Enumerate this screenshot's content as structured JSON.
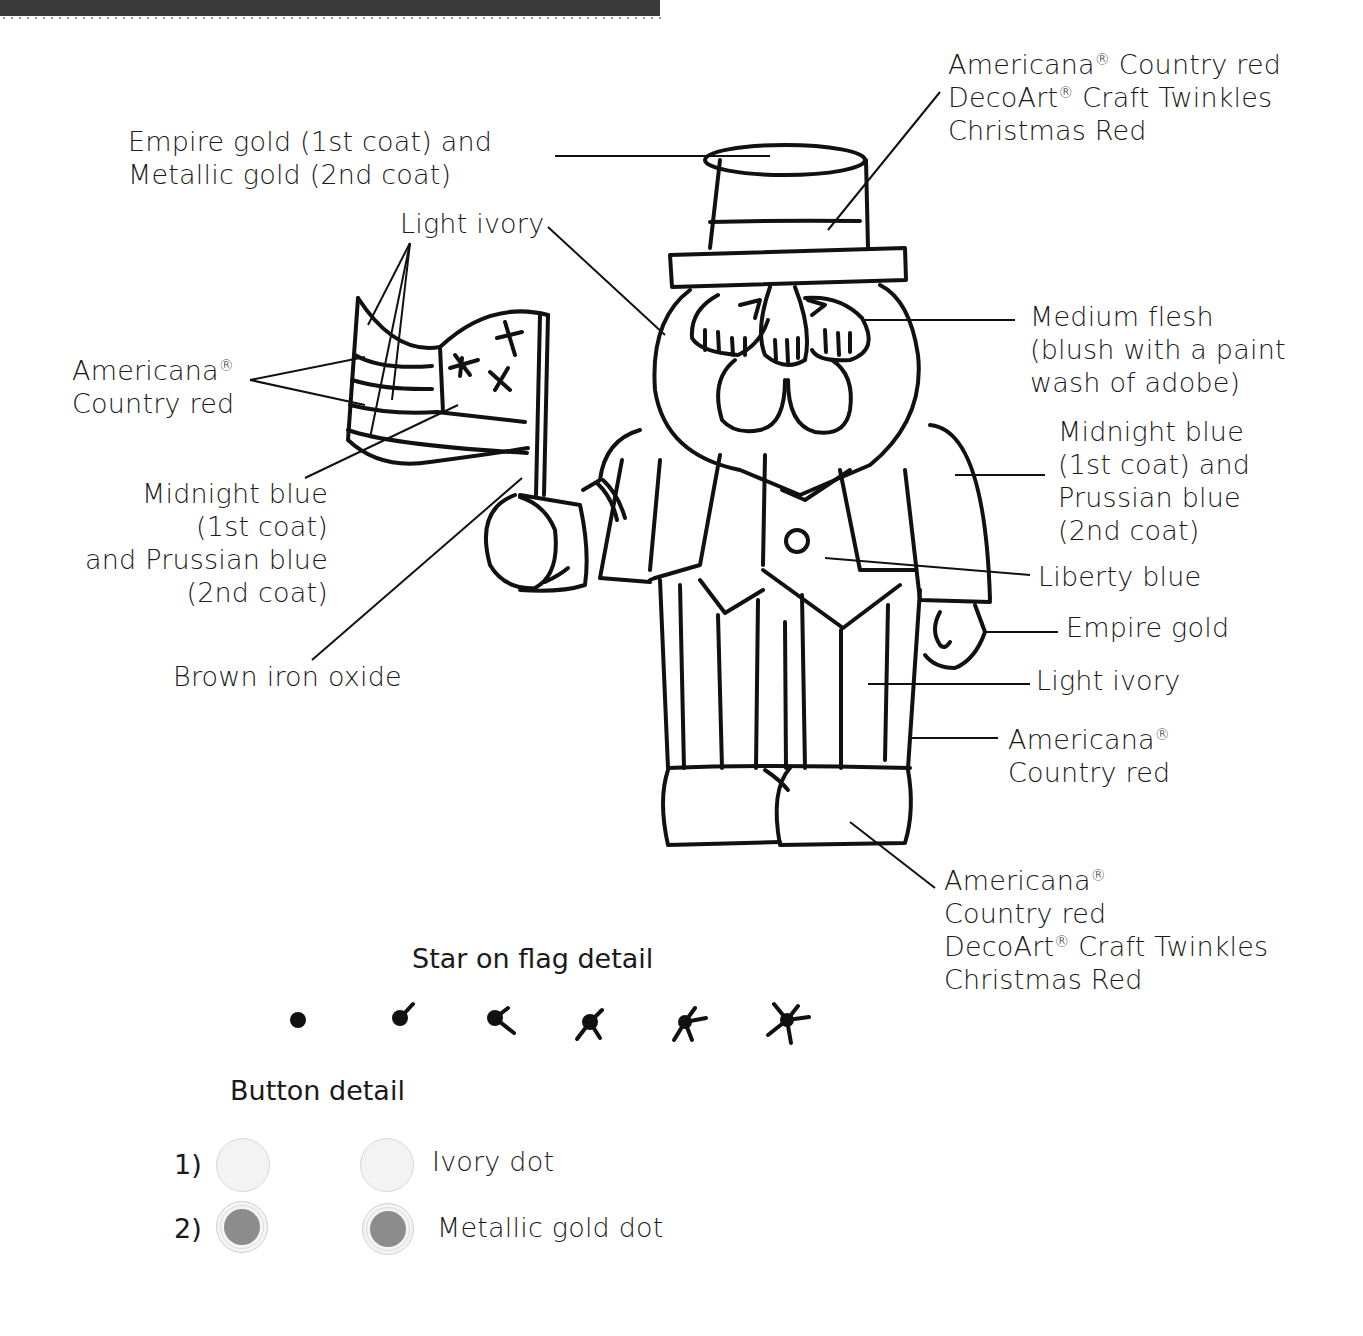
{
  "labels": {
    "hat_band": {
      "lines": [
        "Americana",
        "® Country red",
        "DecoArt",
        "® Craft Twinkles",
        "Christmas Red"
      ],
      "text_1": "Americana",
      "text_1b": " Country red",
      "text_2": "DecoArt",
      "text_2b": " Craft Twinkles",
      "text_3": "Christmas Red"
    },
    "hat_top": {
      "text_1": "Empire gold (1st coat) and",
      "text_2": "Metallic gold (2nd coat)"
    },
    "light_ivory_top": {
      "text": "Light ivory"
    },
    "flag_stripes": {
      "text_1": "Americana",
      "text_2": "Country red"
    },
    "face": {
      "text_1": "Medium flesh",
      "text_2": "(blush with a paint",
      "text_3": "wash of adobe)"
    },
    "coat_right": {
      "text_1": "Midnight blue",
      "text_2": "(1st coat) and",
      "text_3": "Prussian blue",
      "text_4": "(2nd coat)"
    },
    "flag_canton": {
      "text_1": "Midnight blue",
      "text_2": "(1st coat)",
      "text_3": "and Prussian blue",
      "text_4": "(2nd coat)"
    },
    "vest": {
      "text": "Liberty blue"
    },
    "hand": {
      "text": "Empire gold"
    },
    "pants": {
      "text": "Light ivory"
    },
    "pants_stripes": {
      "text_1": "Americana",
      "text_2": "Country red"
    },
    "flagpole": {
      "text": "Brown iron oxide"
    },
    "shoes": {
      "text_1": "Americana",
      "text_2": "Country red",
      "text_3": "DecoArt",
      "text_3b": " Craft Twinkles",
      "text_4": "Christmas Red"
    }
  },
  "registered_mark": "®",
  "star_detail": {
    "title": "Star on flag detail",
    "steps": [
      "dot",
      "one-arm",
      "two-arms",
      "three-arms",
      "four-arms",
      "five-arms"
    ]
  },
  "button_detail": {
    "title": "Button detail",
    "rows": [
      {
        "number": "1)",
        "label": "Ivory dot",
        "style": "ivory"
      },
      {
        "number": "2)",
        "label": "Metallic gold dot",
        "style": "gold"
      }
    ]
  },
  "colors": {
    "ink": "#111111",
    "ivory_dot": "#f3f3f3",
    "gold_dot": "#8c8c8c",
    "header_bar": "#3a3a3a"
  }
}
